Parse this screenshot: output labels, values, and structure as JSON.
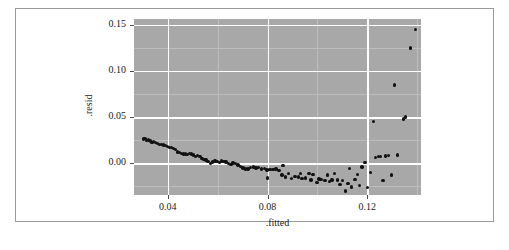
{
  "figure": {
    "background_color": "#ffffff",
    "frame_color": "#9a9a9a",
    "panel_color": "#a8a8a8",
    "gridline_color": "#ffffff",
    "point_color": "#111111"
  },
  "axes": {
    "x_title": ".fitted",
    "y_title": ".resid",
    "x_ticks": [
      "0.04",
      "0.08",
      "0.12"
    ],
    "y_ticks": [
      "0.00",
      "0.05",
      "0.10",
      "0.15"
    ]
  },
  "chart_data": {
    "type": "scatter",
    "title": "",
    "xlabel": ".fitted",
    "ylabel": ".resid",
    "xlim": [
      0.0265,
      0.1415
    ],
    "ylim": [
      -0.0345,
      0.1565
    ],
    "xticks": [
      0.04,
      0.08,
      0.12
    ],
    "yticks": [
      0.0,
      0.05,
      0.1,
      0.15
    ],
    "grid": true,
    "legend": "none",
    "marker": "filled-circle",
    "series": [
      {
        "name": "residuals",
        "points": [
          [
            0.0302,
            0.0262
          ],
          [
            0.0309,
            0.0269
          ],
          [
            0.0314,
            0.0248
          ],
          [
            0.0322,
            0.0251
          ],
          [
            0.033,
            0.024
          ],
          [
            0.0337,
            0.0228
          ],
          [
            0.0344,
            0.0238
          ],
          [
            0.0352,
            0.0224
          ],
          [
            0.0359,
            0.0213
          ],
          [
            0.0367,
            0.0206
          ],
          [
            0.0375,
            0.0202
          ],
          [
            0.0383,
            0.0196
          ],
          [
            0.0391,
            0.019
          ],
          [
            0.0399,
            0.018
          ],
          [
            0.0407,
            0.0172
          ],
          [
            0.0415,
            0.0168
          ],
          [
            0.0423,
            0.016
          ],
          [
            0.0431,
            0.0152
          ],
          [
            0.0439,
            0.0122
          ],
          [
            0.0447,
            0.0116
          ],
          [
            0.0455,
            0.0104
          ],
          [
            0.0463,
            0.0098
          ],
          [
            0.0471,
            0.01
          ],
          [
            0.0479,
            0.0096
          ],
          [
            0.0487,
            0.0104
          ],
          [
            0.0495,
            0.0098
          ],
          [
            0.0504,
            0.009
          ],
          [
            0.0512,
            0.0072
          ],
          [
            0.052,
            0.0084
          ],
          [
            0.0529,
            0.0076
          ],
          [
            0.0537,
            0.005
          ],
          [
            0.0546,
            0.0042
          ],
          [
            0.0554,
            0.0034
          ],
          [
            0.0562,
            0.0018
          ],
          [
            0.0571,
            0.0
          ],
          [
            0.058,
            0.0014
          ],
          [
            0.0589,
            0.0022
          ],
          [
            0.0598,
            0.0016
          ],
          [
            0.0607,
            0.001
          ],
          [
            0.0616,
            0.0024
          ],
          [
            0.0625,
            0.002
          ],
          [
            0.0634,
            0.0012
          ],
          [
            0.0644,
            -0.0002
          ],
          [
            0.0653,
            -0.0014
          ],
          [
            0.0662,
            0.0002
          ],
          [
            0.0672,
            -0.0006
          ],
          [
            0.0682,
            -0.002
          ],
          [
            0.0692,
            -0.0038
          ],
          [
            0.0702,
            -0.0052
          ],
          [
            0.0712,
            -0.0062
          ],
          [
            0.0722,
            -0.0064
          ],
          [
            0.0733,
            -0.0048
          ],
          [
            0.0743,
            -0.004
          ],
          [
            0.0754,
            -0.0052
          ],
          [
            0.0765,
            -0.0046
          ],
          [
            0.0776,
            -0.0062
          ],
          [
            0.0787,
            -0.0058
          ],
          [
            0.0798,
            -0.0072
          ],
          [
            0.08,
            -0.016
          ],
          [
            0.081,
            -0.0068
          ],
          [
            0.0822,
            -0.007
          ],
          [
            0.0834,
            -0.0062
          ],
          [
            0.0846,
            -0.0076
          ],
          [
            0.0858,
            -0.013
          ],
          [
            0.0862,
            -0.0026
          ],
          [
            0.0871,
            -0.015
          ],
          [
            0.0884,
            -0.0114
          ],
          [
            0.0897,
            -0.0168
          ],
          [
            0.091,
            -0.0146
          ],
          [
            0.0924,
            -0.0148
          ],
          [
            0.0931,
            -0.011
          ],
          [
            0.0938,
            -0.0168
          ],
          [
            0.0952,
            -0.016
          ],
          [
            0.0967,
            -0.011
          ],
          [
            0.0975,
            -0.0184
          ],
          [
            0.0982,
            -0.0122
          ],
          [
            0.0998,
            -0.0212
          ],
          [
            0.1006,
            -0.0172
          ],
          [
            0.1014,
            -0.018
          ],
          [
            0.103,
            -0.0186
          ],
          [
            0.104,
            -0.0128
          ],
          [
            0.1048,
            -0.0196
          ],
          [
            0.1058,
            -0.0182
          ],
          [
            0.1068,
            -0.011
          ],
          [
            0.108,
            -0.0184
          ],
          [
            0.109,
            -0.0232
          ],
          [
            0.11,
            -0.0186
          ],
          [
            0.1112,
            -0.03
          ],
          [
            0.1122,
            -0.0218
          ],
          [
            0.1128,
            -0.006
          ],
          [
            0.1136,
            -0.026
          ],
          [
            0.115,
            -0.018
          ],
          [
            0.116,
            -0.0122
          ],
          [
            0.1168,
            -0.0245
          ],
          [
            0.1178,
            -0.004
          ],
          [
            0.119,
            0.001
          ],
          [
            0.12,
            -0.0262
          ],
          [
            0.1212,
            -0.0098
          ],
          [
            0.1225,
            0.0455
          ],
          [
            0.1232,
            0.0062
          ],
          [
            0.1245,
            0.007
          ],
          [
            0.1252,
            0.0072
          ],
          [
            0.1262,
            -0.0186
          ],
          [
            0.1272,
            0.008
          ],
          [
            0.1285,
            0.0086
          ],
          [
            0.1298,
            -0.0128
          ],
          [
            0.131,
            0.085
          ],
          [
            0.1322,
            0.009
          ],
          [
            0.1345,
            0.048
          ],
          [
            0.1352,
            0.05
          ],
          [
            0.1372,
            0.125
          ],
          [
            0.1392,
            0.145
          ]
        ]
      }
    ]
  }
}
